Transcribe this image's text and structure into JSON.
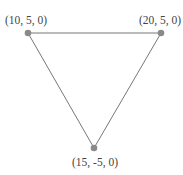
{
  "diagram": {
    "type": "triangle",
    "colors": {
      "edge": "#777777",
      "point": "#8a8a8a",
      "label": "#444444"
    },
    "points": [
      {
        "label": "(10, 5, 0)",
        "coords": [
          10,
          5,
          0
        ],
        "px": [
          28,
          33
        ],
        "label_px": [
          26,
          24
        ]
      },
      {
        "label": "(20, 5, 0)",
        "coords": [
          20,
          5,
          0
        ],
        "px": [
          161,
          33
        ],
        "label_px": [
          160,
          24
        ]
      },
      {
        "label": "(15, -5, 0)",
        "coords": [
          15,
          -5,
          0
        ],
        "px": [
          94,
          148
        ],
        "label_px": [
          95,
          166
        ]
      }
    ],
    "edges": [
      [
        0,
        1
      ],
      [
        1,
        2
      ],
      [
        2,
        0
      ]
    ]
  }
}
